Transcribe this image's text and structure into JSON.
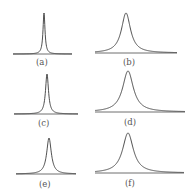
{
  "chart_data": [
    {
      "type": "line",
      "panel": "a",
      "label": "(a)",
      "shape": "lorentzian-peak",
      "width": "very narrow",
      "peak_x": 44,
      "top_y": 13,
      "base_y": 54,
      "x0": 13,
      "x1": 72,
      "hw": 1.2
    },
    {
      "type": "line",
      "panel": "b",
      "label": "(b)",
      "shape": "lorentzian-peak",
      "width": "broad",
      "peak_x": 126,
      "top_y": 13,
      "base_y": 53,
      "x0": 95,
      "x1": 177,
      "hw": 5.5
    },
    {
      "type": "line",
      "panel": "c",
      "label": "(c)",
      "shape": "lorentzian-peak",
      "width": "narrow",
      "peak_x": 47,
      "top_y": 74,
      "base_y": 114,
      "x0": 14,
      "x1": 78,
      "hw": 1.8
    },
    {
      "type": "line",
      "panel": "d",
      "label": "(d)",
      "shape": "lorentzian-peak",
      "width": "broad",
      "peak_x": 128,
      "top_y": 71,
      "base_y": 112,
      "x0": 95,
      "x1": 185,
      "hw": 6.5
    },
    {
      "type": "line",
      "panel": "e",
      "label": "(e)",
      "shape": "lorentzian-peak",
      "width": "narrow-medium",
      "peak_x": 49,
      "top_y": 138,
      "base_y": 174,
      "x0": 16,
      "x1": 76,
      "hw": 2.8
    },
    {
      "type": "line",
      "panel": "f",
      "label": "(f)",
      "shape": "lorentzian-peak",
      "width": "broad",
      "peak_x": 128,
      "top_y": 133,
      "base_y": 173,
      "x0": 95,
      "x1": 184,
      "hw": 6.5
    }
  ],
  "labels": {
    "a": "(a)",
    "b": "(b)",
    "c": "(c)",
    "d": "(d)",
    "e": "(e)",
    "f": "(f)"
  },
  "colors": {
    "line": "#3a3a3a",
    "label": "#555555",
    "background": "#ffffff"
  }
}
